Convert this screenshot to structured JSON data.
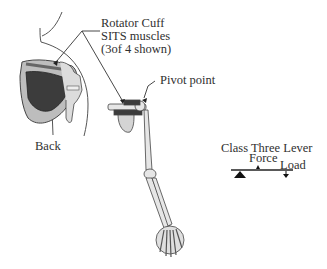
{
  "labels": {
    "rotator_cuff": [
      "Rotator Cuff",
      "SITS muscles",
      "(3of 4  shown)"
    ],
    "pivot_point": "Pivot point",
    "back": "Back",
    "lever_title": "Class Three Lever",
    "force": "Force",
    "load": "Load"
  },
  "colors": {
    "line": "#3a3a3a",
    "bone_fill": "#e6e6e6",
    "muscle_dark": "#3c3c3c",
    "scapula_fill": "#9a9a9a"
  }
}
